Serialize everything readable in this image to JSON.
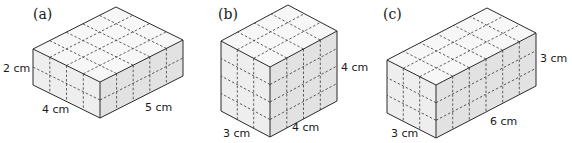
{
  "figures": [
    {
      "id": "a",
      "caption": "(a)",
      "height_label": "2 cm",
      "depth_label": "4 cm",
      "length_label": "5 cm",
      "dims": {
        "height": 2,
        "depth": 4,
        "length": 5
      }
    },
    {
      "id": "b",
      "caption": "(b)",
      "height_label": "4 cm",
      "depth_label": "3 cm",
      "length_label": "4 cm",
      "dims": {
        "height": 4,
        "depth": 3,
        "length": 4
      }
    },
    {
      "id": "c",
      "caption": "(c)",
      "height_label": "3 cm",
      "depth_label": "3 cm",
      "length_label": "6 cm",
      "dims": {
        "height": 3,
        "depth": 3,
        "length": 6
      }
    }
  ],
  "colors": {
    "edge": "#2b2b2b",
    "top_face": "#f7f7f7",
    "left_face": "#eeeeee",
    "right_face": "#e2e2e2"
  }
}
